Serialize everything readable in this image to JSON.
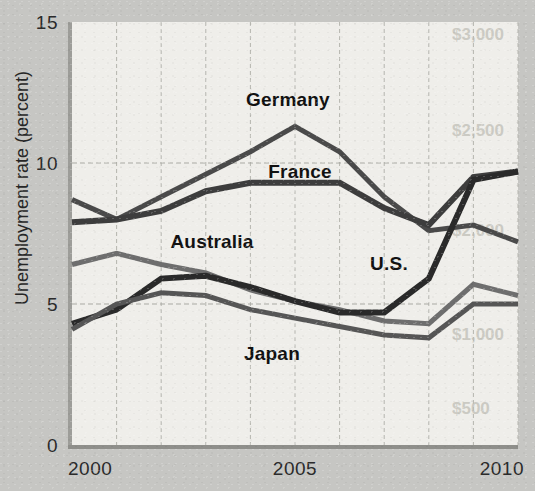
{
  "chart_data": {
    "type": "line",
    "title": "",
    "xlabel": "",
    "ylabel": "Unemployment rate (percent)",
    "xlim": [
      2000,
      2010
    ],
    "ylim": [
      0,
      15
    ],
    "yticks": [
      0,
      5,
      10,
      15
    ],
    "ytick_labels": [
      "0",
      "5",
      "10",
      "15"
    ],
    "xticks": [
      2000,
      2005,
      2010
    ],
    "xtick_labels": [
      "2000",
      "2005",
      "2010"
    ],
    "xgrid_years": [
      2000,
      2001,
      2002,
      2003,
      2004,
      2005,
      2006,
      2007,
      2008,
      2009,
      2010
    ],
    "grid": true,
    "legend": "inline-labels",
    "x": [
      2000,
      2001,
      2002,
      2003,
      2004,
      2005,
      2006,
      2007,
      2008,
      2009,
      2010
    ],
    "series": [
      {
        "name": "Germany",
        "color": "#4a4a4a",
        "width": 5,
        "values": [
          8.7,
          8.0,
          8.8,
          9.6,
          10.4,
          11.3,
          10.4,
          8.8,
          7.6,
          7.8,
          7.2
        ],
        "label": {
          "text": "Germany",
          "x": 288,
          "y": 106,
          "anchor": "middle"
        }
      },
      {
        "name": "France",
        "color": "#3d3d3d",
        "width": 6,
        "values": [
          7.9,
          8.0,
          8.3,
          9.0,
          9.3,
          9.3,
          9.3,
          8.4,
          7.8,
          9.5,
          9.7
        ],
        "label": {
          "text": "France",
          "x": 300,
          "y": 178,
          "anchor": "middle"
        }
      },
      {
        "name": "Australia",
        "color": "#6e6e6e",
        "width": 5,
        "values": [
          6.4,
          6.8,
          6.4,
          6.1,
          5.5,
          5.1,
          4.8,
          4.4,
          4.3,
          5.7,
          5.3
        ],
        "label": {
          "text": "Australia",
          "x": 212,
          "y": 248,
          "anchor": "middle"
        }
      },
      {
        "name": "U.S.",
        "color": "#2a2a2a",
        "width": 6,
        "values": [
          4.3,
          4.8,
          5.9,
          6.0,
          5.6,
          5.1,
          4.7,
          4.7,
          5.9,
          9.4,
          9.7
        ],
        "label": {
          "text": "U.S.",
          "x": 389,
          "y": 270,
          "anchor": "middle"
        }
      },
      {
        "name": "Japan",
        "color": "#565656",
        "width": 5,
        "values": [
          4.1,
          5.0,
          5.4,
          5.3,
          4.8,
          4.5,
          4.2,
          3.9,
          3.8,
          5.0,
          5.0
        ],
        "label": {
          "text": "Japan",
          "x": 272,
          "y": 360,
          "anchor": "middle"
        }
      }
    ],
    "bleed_text": [
      {
        "text": "$3,000",
        "x": 452,
        "y": 40
      },
      {
        "text": "$2,500",
        "x": 452,
        "y": 136
      },
      {
        "text": "$2,000",
        "x": 452,
        "y": 236
      },
      {
        "text": "$1,000",
        "x": 452,
        "y": 340
      },
      {
        "text": "$500",
        "x": 452,
        "y": 414
      }
    ]
  },
  "geometry": {
    "plot_left": 72,
    "plot_right": 518,
    "plot_top": 22,
    "plot_bottom": 445
  }
}
